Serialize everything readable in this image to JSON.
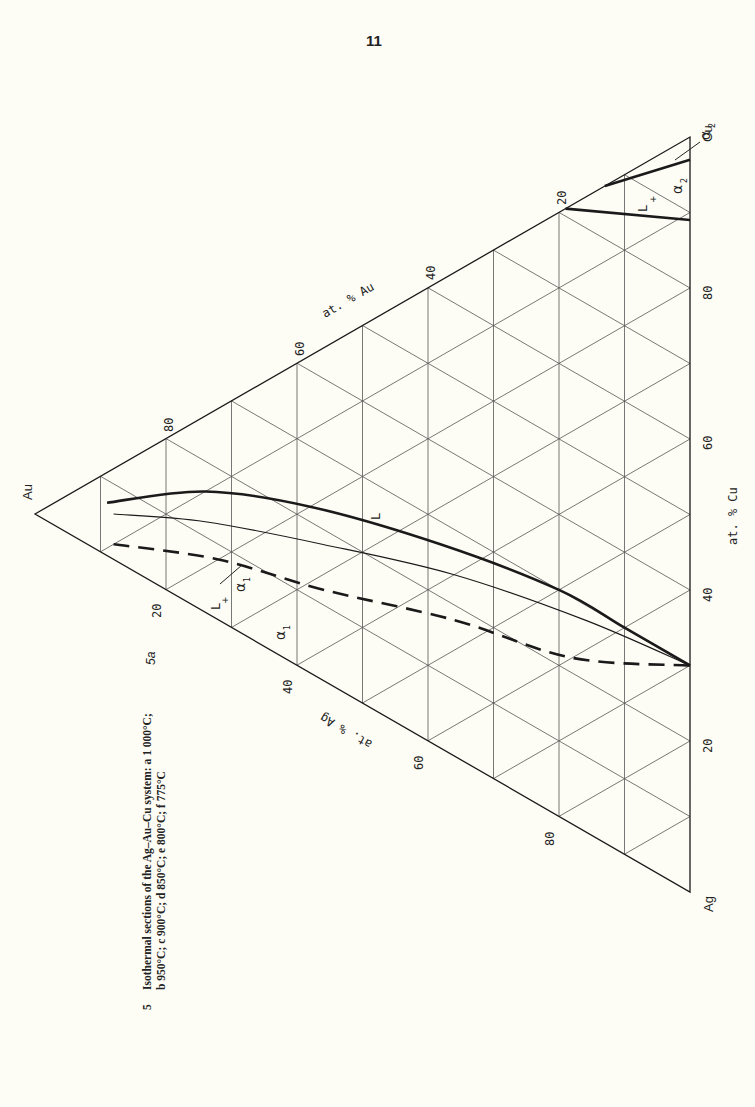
{
  "page": {
    "number": "11",
    "background": "#fdfdf5"
  },
  "figure": {
    "label": "5a",
    "caption_number": "5",
    "caption_line1": "Isothermal sections of the Ag–Au–Cu system: a 1 000°C;",
    "caption_line2": "b 950°C; c 900°C; d 850°C; e 800°C; f 775°C"
  },
  "chart_data": {
    "type": "ternary",
    "vertices": {
      "top_left": "Au",
      "top_right": "Cu",
      "bottom": "Ag"
    },
    "axes": {
      "au": {
        "label": "at. % Au",
        "ticks": [
          20,
          40,
          60,
          80
        ]
      },
      "cu": {
        "label": "at. % Cu",
        "ticks": [
          20,
          40,
          60,
          80
        ]
      },
      "ag": {
        "label": "at. % Ag",
        "ticks": [
          20,
          40,
          60,
          80
        ]
      }
    },
    "grid_step_pct": 10,
    "regions": [
      {
        "label": "L",
        "note": "liquid field"
      },
      {
        "label": "L + α1",
        "note": "two-phase field near Au-Ag side"
      },
      {
        "label": "α1",
        "note": "Au/Ag-rich solid solution"
      },
      {
        "label": "L + α2",
        "note": "two-phase field near Cu corner"
      },
      {
        "label": "α2",
        "note": "Cu-rich solid solution"
      }
    ],
    "curves": [
      {
        "name": "liquidus (L / L+α1)",
        "style": "thick-solid",
        "points_ag_au_cu": [
          [
            4,
            89,
            7
          ],
          [
            10,
            74,
            16
          ],
          [
            20,
            58,
            22
          ],
          [
            35,
            38,
            27
          ],
          [
            50,
            20,
            30
          ],
          [
            60,
            10,
            30
          ],
          [
            70,
            0,
            30
          ]
        ]
      },
      {
        "name": "solidus (L+α1 / α1)",
        "style": "thin-solid",
        "points_ag_au_cu": [
          [
            6,
            88,
            6
          ],
          [
            14,
            74,
            12
          ],
          [
            26,
            56,
            18
          ],
          [
            40,
            36,
            24
          ],
          [
            56,
            16,
            28
          ],
          [
            70,
            0,
            30
          ]
        ]
      },
      {
        "name": "α1 boundary (dashed)",
        "style": "thick-dashed",
        "points_ag_au_cu": [
          [
            10,
            88,
            2
          ],
          [
            20,
            72,
            8
          ],
          [
            32,
            56,
            12
          ],
          [
            46,
            36,
            18
          ],
          [
            60,
            18,
            22
          ],
          [
            70,
            0,
            30
          ]
        ]
      },
      {
        "name": "Cu-side liquidus (L / L+α2)",
        "style": "thick-solid",
        "points_ag_au_cu": [
          [
            0,
            19,
            81
          ],
          [
            11,
            0,
            89
          ]
        ]
      },
      {
        "name": "Cu-side solidus (L+α2 / α2)",
        "style": "thick-solid",
        "points_ag_au_cu": [
          [
            0,
            13,
            87
          ],
          [
            3,
            0,
            97
          ]
        ]
      }
    ]
  },
  "labels": {
    "au": "Au",
    "cu": "Cu",
    "ag": "Ag",
    "axis_au": "at. % Au",
    "axis_cu": "at. % Cu",
    "axis_ag": "at. % Ag",
    "L": "L",
    "L_plus": "L",
    "plus": "+",
    "alpha1": "α",
    "alpha2": "α",
    "sub1": "1",
    "sub2": "2",
    "tick20": "20",
    "tick40": "40",
    "tick60": "60",
    "tick80": "80"
  },
  "colors": {
    "line": "#1a1a1a",
    "grid": "#555555",
    "text": "#222222"
  }
}
